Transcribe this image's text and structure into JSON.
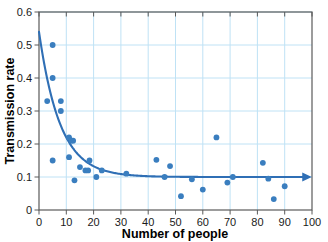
{
  "chart_data": {
    "type": "scatter",
    "title": "",
    "xlabel": "Number of people",
    "ylabel": "Transmission rate",
    "xlim": [
      0,
      100
    ],
    "ylim": [
      0,
      0.6
    ],
    "xticks": [
      0,
      10,
      20,
      30,
      40,
      50,
      60,
      70,
      80,
      90,
      100
    ],
    "xtick_labels": [
      "0",
      "10",
      "20",
      "30",
      "40",
      "50",
      "60",
      "70",
      "80",
      "90",
      "100"
    ],
    "yticks": [
      0,
      0.1,
      0.2,
      0.3,
      0.4,
      0.5,
      0.6
    ],
    "ytick_labels": [
      "0",
      "0.1",
      "0.2",
      "0.3",
      "0.4",
      "0.5",
      "0.6"
    ],
    "grid": true,
    "grid_color": "#bfe2f5",
    "frame_color": "#5a5a5a",
    "marker_color": "#3a7ebf",
    "line_color": "#2f6fb5",
    "legend": null,
    "points": [
      {
        "x": 3,
        "y": 0.33
      },
      {
        "x": 5,
        "y": 0.5
      },
      {
        "x": 5,
        "y": 0.4
      },
      {
        "x": 5,
        "y": 0.15
      },
      {
        "x": 8,
        "y": 0.33
      },
      {
        "x": 8,
        "y": 0.3
      },
      {
        "x": 11,
        "y": 0.22
      },
      {
        "x": 11,
        "y": 0.16
      },
      {
        "x": 12,
        "y": 0.21
      },
      {
        "x": 12.5,
        "y": 0.21
      },
      {
        "x": 13,
        "y": 0.09
      },
      {
        "x": 15,
        "y": 0.13
      },
      {
        "x": 17,
        "y": 0.12
      },
      {
        "x": 18,
        "y": 0.12
      },
      {
        "x": 18.5,
        "y": 0.15
      },
      {
        "x": 21,
        "y": 0.1
      },
      {
        "x": 23,
        "y": 0.12
      },
      {
        "x": 32,
        "y": 0.11
      },
      {
        "x": 43,
        "y": 0.152
      },
      {
        "x": 46,
        "y": 0.1
      },
      {
        "x": 48,
        "y": 0.133
      },
      {
        "x": 52,
        "y": 0.042
      },
      {
        "x": 56,
        "y": 0.093
      },
      {
        "x": 60,
        "y": 0.062
      },
      {
        "x": 65,
        "y": 0.22
      },
      {
        "x": 69,
        "y": 0.083
      },
      {
        "x": 71,
        "y": 0.1
      },
      {
        "x": 82,
        "y": 0.143
      },
      {
        "x": 84,
        "y": 0.095
      },
      {
        "x": 86,
        "y": 0.033
      },
      {
        "x": 90,
        "y": 0.072
      }
    ],
    "trend_curve": {
      "description": "exponential decay toward asymptote",
      "asymptote": 0.1,
      "y_at_x0": 0.54,
      "decay_rate": 0.13,
      "arrow_head": true,
      "x_end": 100
    }
  }
}
